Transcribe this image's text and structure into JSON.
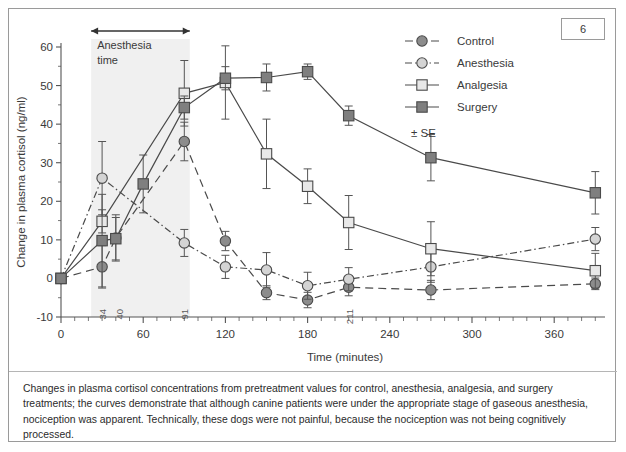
{
  "page": {
    "badge_number": "6"
  },
  "caption": {
    "text": "Changes in plasma cortisol concentrations from pretreatment values for control, anesthesia, analgesia, and surgery treatments; the curves demonstrate that although canine patients were under the appropriate stage of gaseous anesthesia, nociception was apparent. Technically, these dogs were not painful, because the nociception was not being cognitively processed."
  },
  "legend": {
    "se_note": "± SE",
    "entries": [
      {
        "label": "Control",
        "marker": "circle",
        "fill": "#8c8c8c",
        "dash": "8,5"
      },
      {
        "label": "Anesthesia",
        "marker": "circle",
        "fill": "#d4d4d4",
        "dash": "7,3,1.5,3"
      },
      {
        "label": "Analgesia",
        "marker": "square",
        "fill": "#e8e8e8",
        "dash": "none"
      },
      {
        "label": "Surgery",
        "marker": "square",
        "fill": "#7f7f7f",
        "dash": "none"
      }
    ]
  },
  "annotations": {
    "span_label_line1": "Anesthesia",
    "span_label_line2": "time",
    "span_start_min": 22,
    "span_end_min": 94,
    "point_labels": [
      {
        "text": "34",
        "x_min": 30
      },
      {
        "text": "40",
        "x_min": 42
      },
      {
        "text": "91",
        "x_min": 90
      },
      {
        "text": "211",
        "x_min": 210
      }
    ]
  },
  "chart_data": {
    "type": "line",
    "title": "",
    "xlabel": "Time (minutes)",
    "ylabel": "Change in plasma cortisol (ng/ml)",
    "x": [
      0,
      30,
      40,
      60,
      90,
      120,
      150,
      180,
      210,
      270,
      390
    ],
    "xlim": [
      0,
      400
    ],
    "ylim": [
      -10,
      60
    ],
    "xticks": [
      0,
      60,
      120,
      180,
      240,
      300,
      360
    ],
    "yticks": [
      -10,
      0,
      10,
      20,
      30,
      40,
      50,
      60
    ],
    "grid": false,
    "legend_position": "top-right",
    "error_note": "± SE",
    "series": [
      {
        "name": "Control",
        "marker": "circle",
        "fill": "#8c8c8c",
        "dash": "8,5",
        "values": [
          0,
          3.0,
          10.5,
          null,
          35.5,
          9.7,
          -3.7,
          -5.6,
          -2.3,
          -3.0,
          -1.4
        ],
        "errors": [
          0,
          5.5,
          6.0,
          null,
          5.0,
          2.5,
          1.8,
          2.0,
          2.2,
          2.5,
          1.5
        ]
      },
      {
        "name": "Anesthesia",
        "marker": "circle",
        "fill": "#d4d4d4",
        "dash": "7,3,1.5,3",
        "values": [
          0,
          26.0,
          null,
          null,
          9.2,
          3.0,
          2.2,
          -1.9,
          -0.2,
          3.0,
          10.2
        ],
        "errors": [
          0,
          9.5,
          null,
          null,
          3.5,
          3.0,
          4.5,
          3.5,
          3.0,
          4.0,
          3.0
        ]
      },
      {
        "name": "Analgesia",
        "marker": "square",
        "fill": "#e8e8e8",
        "dash": "none",
        "values": [
          0,
          14.8,
          null,
          null,
          48.0,
          50.8,
          32.3,
          23.9,
          14.5,
          7.7,
          2.0
        ],
        "errors": [
          0,
          3.0,
          null,
          null,
          8.5,
          9.5,
          9.0,
          4.5,
          7.0,
          7.0,
          4.5
        ]
      },
      {
        "name": "Surgery",
        "marker": "square",
        "fill": "#7f7f7f",
        "dash": "none",
        "values": [
          0,
          9.8,
          10.3,
          24.5,
          44.3,
          51.9,
          52.1,
          53.6,
          42.2,
          31.3,
          22.2
        ],
        "errors": [
          0,
          12.0,
          5.5,
          7.5,
          3.0,
          3.0,
          3.5,
          2.0,
          2.5,
          6.0,
          5.5
        ]
      }
    ]
  }
}
